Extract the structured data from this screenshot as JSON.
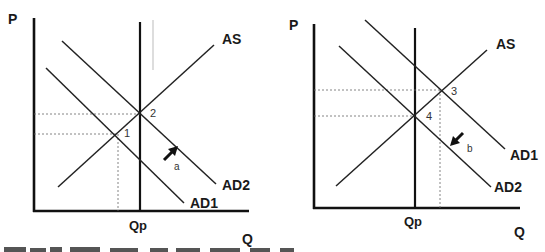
{
  "diagrams": [
    {
      "id": "left",
      "y_axis_label": "P",
      "x_axis_label": "Q",
      "vertical_line_label": "Qp",
      "curves": {
        "as": "AS",
        "ad1": "AD1",
        "ad2": "AD2"
      },
      "points": {
        "first": "1",
        "second": "2"
      },
      "shift_arrow": {
        "label": "a",
        "direction": "up-right"
      }
    },
    {
      "id": "right",
      "y_axis_label": "P",
      "x_axis_label": "Q",
      "vertical_line_label": "Qp",
      "curves": {
        "as": "AS",
        "ad1": "AD1",
        "ad2": "AD2"
      },
      "points": {
        "first": "3",
        "second": "4"
      },
      "shift_arrow": {
        "label": "b",
        "direction": "down-left"
      }
    }
  ],
  "colors": {
    "line": "#111111",
    "dashed": "#666666",
    "background": "#ffffff"
  }
}
